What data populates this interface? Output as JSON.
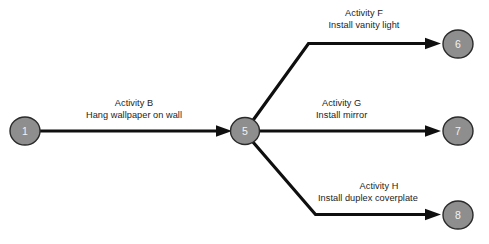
{
  "diagram": {
    "type": "activity-on-arrow-network",
    "background_color": "#ffffff",
    "node_fill_color": "#8e8e8e",
    "node_stroke_color": "#2a2a2a",
    "node_text_color": "#f2f2f2",
    "edge_color": "#100f0f",
    "label_text_color": "#1c1c1c"
  },
  "nodes": [
    {
      "id": "node-1",
      "label": "1",
      "cx": 25,
      "cy": 131,
      "rx": 15,
      "ry": 14
    },
    {
      "id": "node-5",
      "label": "5",
      "cx": 245,
      "cy": 131,
      "rx": 14.5,
      "ry": 13.5
    },
    {
      "id": "node-6",
      "label": "6",
      "cx": 458,
      "cy": 44,
      "rx": 15,
      "ry": 14
    },
    {
      "id": "node-7",
      "label": "7",
      "cx": 458,
      "cy": 131,
      "rx": 15,
      "ry": 14
    },
    {
      "id": "node-8",
      "label": "8",
      "cx": 458,
      "cy": 215,
      "rx": 15,
      "ry": 14
    }
  ],
  "edges": [
    {
      "id": "edge-b",
      "from": "1",
      "to": "5",
      "activity": "Activity B",
      "description": "Hang wallpaper on wall"
    },
    {
      "id": "edge-f",
      "from": "5",
      "to": "6",
      "activity": "Activity F",
      "description": "Install vanity light"
    },
    {
      "id": "edge-g",
      "from": "5",
      "to": "7",
      "activity": "Activity G",
      "description": "Install mirror"
    },
    {
      "id": "edge-h",
      "from": "5",
      "to": "8",
      "activity": "Activity H",
      "description": "Install duplex coverplate"
    }
  ]
}
